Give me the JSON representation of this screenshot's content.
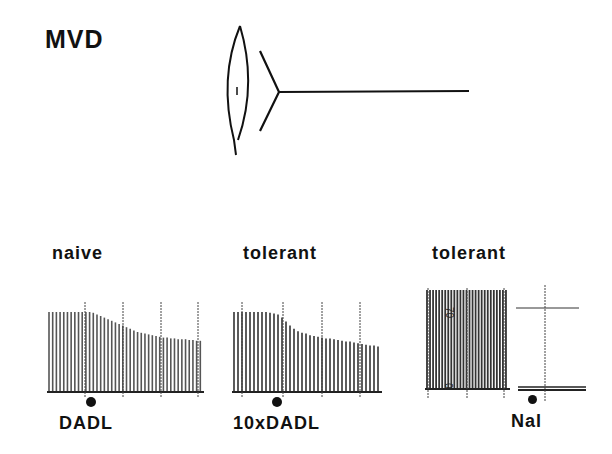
{
  "figure": {
    "prep_label": "MVD",
    "diagram": "vas deferens with stimulating electrode / transducer schematic"
  },
  "panels": [
    {
      "condition": "naive",
      "drug": "DADL",
      "marker": "drug application dot",
      "trend": "twitch height declines ~35% after DADL, partial plateau"
    },
    {
      "condition": "tolerant",
      "drug": "10xDADL",
      "marker": "drug application dot",
      "trend": "twitch height declines ~40% after 10x DADL"
    },
    {
      "condition": "tolerant",
      "drug": "Nal",
      "marker": "drug application dot",
      "scale_top": "70",
      "scale_bottom": "0",
      "trend": "naloxone after withdrawal; baseline trace flat"
    }
  ],
  "chart_data": [
    {
      "type": "bar",
      "title": "naive",
      "annotation": "DADL",
      "xlabel": "time (twitch index)",
      "ylabel": "twitch amplitude (relative)",
      "values": [
        1,
        1,
        1,
        1,
        1,
        1,
        1,
        1,
        1,
        1,
        1,
        1,
        0.99,
        0.97,
        0.95,
        0.93,
        0.91,
        0.89,
        0.87,
        0.85,
        0.83,
        0.81,
        0.79,
        0.77,
        0.75,
        0.74,
        0.73,
        0.72,
        0.71,
        0.7,
        0.69,
        0.68,
        0.68,
        0.67,
        0.67,
        0.66,
        0.66,
        0.66,
        0.65,
        0.65,
        0.64,
        0.64
      ],
      "ylim": [
        0,
        1
      ]
    },
    {
      "type": "bar",
      "title": "tolerant",
      "annotation": "10 x DADL",
      "xlabel": "time (twitch index)",
      "ylabel": "twitch amplitude (relative)",
      "values": [
        1,
        1,
        1,
        1,
        1,
        1,
        1,
        1,
        1,
        0.99,
        0.98,
        0.97,
        0.93,
        0.88,
        0.83,
        0.79,
        0.76,
        0.74,
        0.73,
        0.71,
        0.7,
        0.69,
        0.68,
        0.67,
        0.67,
        0.66,
        0.65,
        0.64,
        0.63,
        0.63,
        0.62,
        0.61,
        0.6,
        0.59,
        0.58,
        0.58,
        0.57
      ],
      "ylim": [
        0,
        1
      ]
    },
    {
      "type": "bar",
      "title": "tolerant",
      "annotation": "Nal",
      "xlabel": "time",
      "ylabel": "tension",
      "ytick_labels": [
        "0",
        "70"
      ],
      "values": [
        1,
        1,
        1,
        1,
        1,
        1,
        1,
        1,
        1,
        1,
        1,
        1,
        1,
        1,
        1,
        1,
        1,
        1,
        1,
        1,
        1,
        1,
        1,
        1,
        1,
        1,
        1
      ],
      "post_values": "flat baseline near 0",
      "ylim": [
        0,
        1
      ]
    }
  ]
}
